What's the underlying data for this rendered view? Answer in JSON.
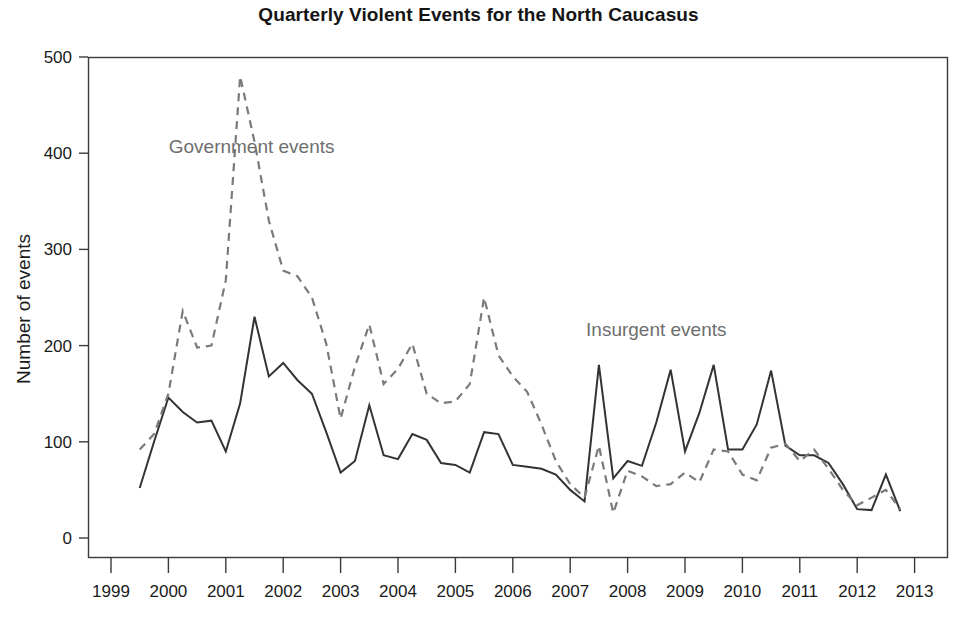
{
  "chart_data": {
    "type": "line",
    "title": "Quarterly Violent Events for the North Caucasus",
    "xlabel": "",
    "ylabel": "Number of events",
    "xlim": [
      1999.0,
      2013.0
    ],
    "ylim": [
      0,
      500
    ],
    "yticks": [
      0,
      100,
      200,
      300,
      400,
      500
    ],
    "ytick_labels": [
      "0",
      "100",
      "200",
      "300",
      "400",
      "500"
    ],
    "xticks": [
      1999,
      2000,
      2001,
      2002,
      2003,
      2004,
      2005,
      2006,
      2007,
      2008,
      2009,
      2010,
      2011,
      2012,
      2013
    ],
    "xtick_labels": [
      "1999",
      "2000",
      "2001",
      "2002",
      "2003",
      "2004",
      "2005",
      "2006",
      "2007",
      "2008",
      "2009",
      "2010",
      "2011",
      "2012",
      "2013"
    ],
    "grid": false,
    "legend_position": "inline-annotations",
    "x": [
      1999.5,
      1999.75,
      2000.0,
      2000.25,
      2000.5,
      2000.75,
      2001.0,
      2001.25,
      2001.5,
      2001.75,
      2002.0,
      2002.25,
      2002.5,
      2002.75,
      2003.0,
      2003.25,
      2003.5,
      2003.75,
      2004.0,
      2004.25,
      2004.5,
      2004.75,
      2005.0,
      2005.25,
      2005.5,
      2005.75,
      2006.0,
      2006.25,
      2006.5,
      2006.75,
      2007.0,
      2007.25,
      2007.5,
      2007.75,
      2008.0,
      2008.25,
      2008.5,
      2008.75,
      2009.0,
      2009.25,
      2009.5,
      2009.75,
      2010.0,
      2010.25,
      2010.5,
      2010.75,
      2011.0,
      2011.25,
      2011.5,
      2011.75,
      2012.0,
      2012.25,
      2012.5,
      2012.75
    ],
    "series": [
      {
        "name": "Insurgent events",
        "style": "solid",
        "color": "#333333",
        "annotation_x": 2008.5,
        "annotation_y": 210,
        "values": [
          52,
          100,
          146,
          131,
          120,
          122,
          90,
          140,
          230,
          168,
          182,
          164,
          150,
          110,
          68,
          80,
          138,
          86,
          82,
          108,
          102,
          78,
          76,
          68,
          110,
          108,
          76,
          74,
          72,
          66,
          50,
          38,
          180,
          62,
          80,
          75,
          120,
          175,
          90,
          130,
          180,
          92,
          92,
          118,
          174,
          96,
          86,
          86,
          78,
          56,
          30,
          29,
          66,
          28
        ]
      },
      {
        "name": "Government events",
        "style": "dashed",
        "color": "#7a7a7a",
        "annotation_x": 2001.45,
        "annotation_y": 400,
        "values": [
          92,
          108,
          150,
          236,
          198,
          200,
          268,
          480,
          412,
          330,
          278,
          272,
          250,
          202,
          124,
          178,
          222,
          160,
          176,
          202,
          150,
          140,
          142,
          160,
          250,
          190,
          168,
          152,
          118,
          80,
          56,
          42,
          96,
          26,
          70,
          64,
          54,
          56,
          68,
          58,
          92,
          90,
          66,
          60,
          94,
          98,
          80,
          92,
          72,
          50,
          34,
          42,
          50,
          30
        ]
      }
    ]
  },
  "annotations": {
    "government_label": "Government events",
    "insurgent_label": "Insurgent events"
  }
}
